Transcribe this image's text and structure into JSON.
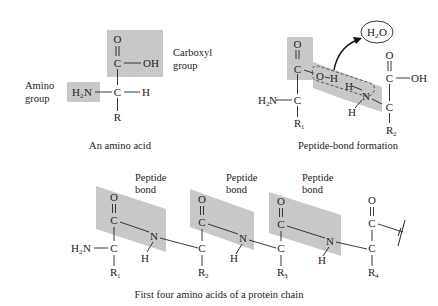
{
  "colors": {
    "shade": "#c8c8c8",
    "ink": "#222222",
    "background": "#ffffff"
  },
  "panel_amino_acid": {
    "caption": "An amino acid",
    "amino_label_1": "Amino",
    "amino_label_2": "group",
    "carboxyl_label_1": "Carboxyl",
    "carboxyl_label_2": "group",
    "atoms": {
      "O": "O",
      "C_carbonyl": "C",
      "OH": "OH",
      "H2N": "H",
      "H2N_sub": "2",
      "H2N_N": "N",
      "C_alpha": "C",
      "H": "H",
      "R": "R"
    }
  },
  "panel_peptide_formation": {
    "caption": "Peptide-bond formation",
    "water": "H",
    "water_sub": "2",
    "water_O": "O",
    "atoms": {
      "O1": "O",
      "C1": "C",
      "OH_O": "O",
      "OH_H": "H",
      "H_amine": "H",
      "N": "N",
      "H_N": "H",
      "H2N": "H",
      "H2N_sub": "2",
      "H2N_N": "N",
      "C_alpha1": "C",
      "R1": "R",
      "R1_sub": "1",
      "O2": "O",
      "C2": "C",
      "OH2": "OH",
      "C_alpha2": "C",
      "R2": "R",
      "R2_sub": "2"
    }
  },
  "panel_protein_chain": {
    "caption": "First four amino acids of a protein chain",
    "bond_labels": [
      {
        "line1": "Peptide",
        "line2": "bond"
      },
      {
        "line1": "Peptide",
        "line2": "bond"
      },
      {
        "line1": "Peptide",
        "line2": "bond"
      }
    ],
    "terminus": {
      "H": "H",
      "sub": "2",
      "N": "N"
    },
    "residues": [
      {
        "O": "O",
        "C": "C",
        "Ca": "C",
        "R": "R",
        "R_sub": "1",
        "N": "N",
        "H": "H"
      },
      {
        "O": "O",
        "C": "C",
        "Ca": "C",
        "R": "R",
        "R_sub": "2",
        "N": "N",
        "H": "H"
      },
      {
        "O": "O",
        "C": "C",
        "Ca": "C",
        "R": "R",
        "R_sub": "3",
        "N": "N",
        "H": "H"
      },
      {
        "O": "O",
        "C": "C",
        "Ca": "C",
        "R": "R",
        "R_sub": "4"
      }
    ]
  }
}
